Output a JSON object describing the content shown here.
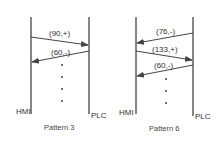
{
  "diagrams": [
    {
      "caption": "Pattern 3",
      "left_entity": "HMI",
      "right_entity": "PLC",
      "messages": [
        {
          "label": "(90,+)",
          "direction": "HMI->PLC"
        },
        {
          "label": "(60,-)",
          "direction": "PLC->HMI"
        }
      ],
      "continuation": "..."
    },
    {
      "caption": "Pattern 6",
      "left_entity": "HMI",
      "right_entity": "PLC",
      "messages": [
        {
          "label": "(76,-)",
          "direction": "PLC->HMI"
        },
        {
          "label": "(133,+)",
          "direction": "HMI->PLC"
        },
        {
          "label": "(60,-)",
          "direction": "PLC->HMI"
        }
      ],
      "continuation": "..."
    }
  ],
  "colors": {
    "line": "#444444",
    "text": "#333333",
    "background": "#ffffff"
  }
}
